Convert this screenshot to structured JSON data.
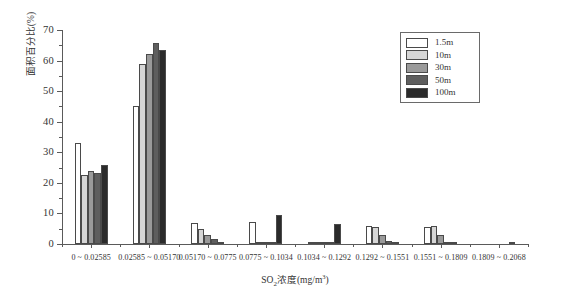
{
  "chart_data": {
    "type": "bar",
    "title": "",
    "xlabel": "SO₂浓度(mg/m³)",
    "ylabel": "面积百分比(%)",
    "ylim": [
      0,
      70
    ],
    "yticks": [
      0,
      10,
      20,
      30,
      40,
      50,
      60,
      70
    ],
    "ytick_labels": [
      "0",
      "10",
      "20",
      "30",
      "40",
      "50",
      "60",
      "70"
    ],
    "grid": false,
    "legend_position": "top-right",
    "categories": [
      "0 ~ 0.02585",
      "0.02585 ~ 0.05170",
      "0.05170 ~ 0.0775",
      "0.0775 ~ 0.1034",
      "0.1034 ~ 0.1292",
      "0.1292 ~ 0.1551",
      "0.1551 ~ 0.1809",
      "0.1809 ~ 0.2068"
    ],
    "series": [
      {
        "name": "1.5m",
        "color": "#ffffff",
        "values": [
          33.2,
          45.3,
          6.8,
          7.3,
          0.4,
          6.0,
          5.5,
          0.0
        ]
      },
      {
        "name": "10m",
        "color": "#d6d6d6",
        "values": [
          22.5,
          59.0,
          5.0,
          0.3,
          0.3,
          5.6,
          5.8,
          0.0
        ]
      },
      {
        "name": "30m",
        "color": "#9a9a9a",
        "values": [
          24.0,
          62.3,
          3.0,
          0.3,
          0.3,
          3.0,
          3.0,
          0.0
        ]
      },
      {
        "name": "50m",
        "color": "#5e5e5e",
        "values": [
          23.2,
          65.8,
          1.5,
          0.3,
          0.3,
          1.0,
          0.6,
          0.0
        ]
      },
      {
        "name": "100m",
        "color": "#2b2b2b",
        "values": [
          25.7,
          63.3,
          0.5,
          9.5,
          6.6,
          0.3,
          0.2,
          0.3
        ]
      }
    ]
  },
  "legend": {
    "entries": [
      {
        "label": "1.5m",
        "color": "#ffffff"
      },
      {
        "label": "10m",
        "color": "#d6d6d6"
      },
      {
        "label": "30m",
        "color": "#9a9a9a"
      },
      {
        "label": "50m",
        "color": "#5e5e5e"
      },
      {
        "label": "100m",
        "color": "#2b2b2b"
      }
    ]
  }
}
